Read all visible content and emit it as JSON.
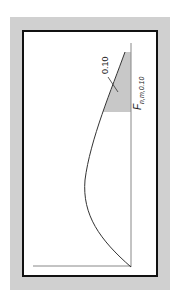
{
  "figure": {
    "type": "F-distribution density (rotated 90°)",
    "tail_area_label": "0.10",
    "critical_value_label": {
      "base": "F",
      "subscript": "n,m,0.10"
    },
    "colors": {
      "frame": "#d0d0d0",
      "border": "#111111",
      "shade": "#c8c8c8",
      "curve": "#333333",
      "axis": "#888888"
    }
  }
}
